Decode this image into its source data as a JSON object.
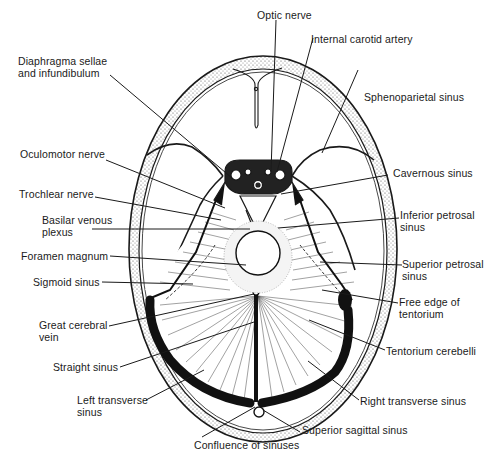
{
  "figure": {
    "colors": {
      "ink": "#1a1a1a",
      "paper": "#ffffff",
      "bone_stipple": "#7a7a7a"
    }
  },
  "labels": {
    "optic_nerve": "Optic nerve",
    "internal_carotid_artery": "Internal carotid artery",
    "diaphragma_sellae_1": "Diaphragma sellae",
    "diaphragma_sellae_2": "and infundibulum",
    "sphenoparietal_sinus": "Sphenoparietal sinus",
    "oculomotor_nerve": "Oculomotor nerve",
    "cavernous_sinus": "Cavernous sinus",
    "trochlear_nerve": "Trochlear nerve",
    "inferior_petrosal_1": "Inferior petrosal",
    "inferior_petrosal_2": "sinus",
    "basilar_venous_1": "Basilar venous",
    "basilar_venous_2": "plexus",
    "foramen_magnum": "Foramen magnum",
    "superior_petrosal_1": "Superior petrosal",
    "superior_petrosal_2": "sinus",
    "sigmoid_sinus": "Sigmoid sinus",
    "free_edge_1": "Free edge of",
    "free_edge_2": "tentorium",
    "great_cerebral_1": "Great cerebral",
    "great_cerebral_2": "vein",
    "tentorium_cerebelli": "Tentorium cerebelli",
    "straight_sinus": "Straight sinus",
    "left_transverse_1": "Left transverse",
    "left_transverse_2": "sinus",
    "right_transverse_sinus": "Right transverse sinus",
    "superior_sagittal_sinus": "Superior sagittal sinus",
    "confluence_of_sinuses": "Confluence of sinuses"
  }
}
